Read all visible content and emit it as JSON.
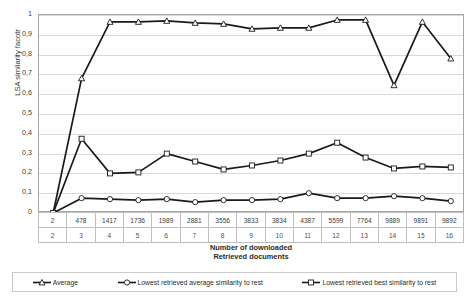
{
  "chart_data": {
    "type": "line",
    "title": "",
    "xlabel": "Number of downloaded\nRetrieved documents",
    "ylabel": "LSA similarity facotr",
    "ylim": [
      0,
      1
    ],
    "yticks": [
      "0",
      "0,1",
      "0,2",
      "0,3",
      "0,4",
      "0,5",
      "0,6",
      "0,7",
      "0,8",
      "0,9",
      "1"
    ],
    "ytick_values": [
      0,
      0.1,
      0.2,
      0.3,
      0.4,
      0.5,
      0.6,
      0.7,
      0.8,
      0.9,
      1
    ],
    "grid": true,
    "legend_position": "bottom",
    "categories": [
      "2",
      "478",
      "1417",
      "1736",
      "1989",
      "2881",
      "3556",
      "3833",
      "3834",
      "4387",
      "5599",
      "7764",
      "9889",
      "9891",
      "9892"
    ],
    "category_index": [
      "2",
      "3",
      "4",
      "5",
      "6",
      "7",
      "8",
      "9",
      "10",
      "11",
      "12",
      "13",
      "14",
      "15",
      "16"
    ],
    "x_header_rows": [
      {
        "name": "downloaded-documents",
        "values": [
          "2",
          "478",
          "1417",
          "1736",
          "1989",
          "2881",
          "3556",
          "3833",
          "3834",
          "4387",
          "5599",
          "7764",
          "9889",
          "9891",
          "9892"
        ]
      },
      {
        "name": "retrieved-documents",
        "values": [
          "2",
          "3",
          "4",
          "5",
          "6",
          "7",
          "8",
          "9",
          "10",
          "11",
          "12",
          "13",
          "14",
          "15",
          "16"
        ]
      }
    ],
    "series": [
      {
        "name": "Average",
        "marker": "triangle",
        "color": "#1a1a1a",
        "values": [
          0.0,
          0.68,
          0.965,
          0.965,
          0.97,
          0.96,
          0.955,
          0.93,
          0.935,
          0.935,
          0.975,
          0.975,
          0.645,
          0.965,
          0.78
        ]
      },
      {
        "name": "Lowest retrieved average similarity to rest",
        "marker": "circle",
        "color": "#1a1a1a",
        "values": [
          0.0,
          0.075,
          0.07,
          0.065,
          0.07,
          0.055,
          0.065,
          0.065,
          0.07,
          0.1,
          0.075,
          0.075,
          0.085,
          0.075,
          0.06
        ]
      },
      {
        "name": "Lowest retrieved best similarity to rest",
        "marker": "square",
        "color": "#1a1a1a",
        "values": [
          0.0,
          0.375,
          0.2,
          0.205,
          0.3,
          0.26,
          0.22,
          0.24,
          0.265,
          0.3,
          0.355,
          0.28,
          0.225,
          0.235,
          0.23
        ]
      }
    ]
  },
  "legend": {
    "items": [
      {
        "label": "Average",
        "marker": "triangle"
      },
      {
        "label": "Lowest retrieved average similarity to rest",
        "marker": "circle"
      },
      {
        "label": "Lowest retrieved best similarity to rest",
        "marker": "square"
      }
    ]
  },
  "axis": {
    "x_title_line1": "Number of downloaded",
    "x_title_line2": "Retrieved documents",
    "y_title": "LSA similarity facotr"
  }
}
